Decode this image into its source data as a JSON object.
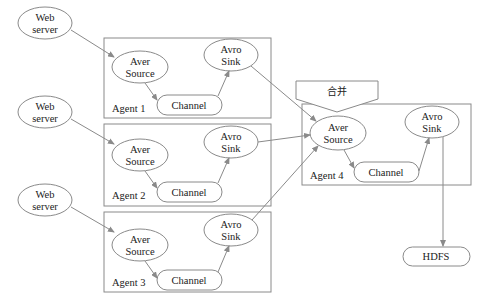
{
  "web_servers": [
    {
      "line1": "Web",
      "line2": "server"
    },
    {
      "line1": "Web",
      "line2": "server"
    },
    {
      "line1": "Web",
      "line2": "server"
    }
  ],
  "agents": [
    {
      "label": "Agent 1",
      "source_l1": "Aver",
      "source_l2": "Source",
      "sink_l1": "Avro",
      "sink_l2": "Sink",
      "channel": "Channel"
    },
    {
      "label": "Agent 2",
      "source_l1": "Aver",
      "source_l2": "Source",
      "sink_l1": "Avro",
      "sink_l2": "Sink",
      "channel": "Channel"
    },
    {
      "label": "Agent 3",
      "source_l1": "Aver",
      "source_l2": "Source",
      "sink_l1": "Avro",
      "sink_l2": "Sink",
      "channel": "Channel"
    },
    {
      "label": "Agent 4",
      "source_l1": "Aver",
      "source_l2": "Source",
      "sink_l1": "Avro",
      "sink_l2": "Sink",
      "channel": "Channel"
    }
  ],
  "merge_label": "合并",
  "hdfs_label": "HDFS",
  "colors": {
    "stroke": "#8a8a8a",
    "text": "#222222",
    "background": "#ffffff"
  }
}
